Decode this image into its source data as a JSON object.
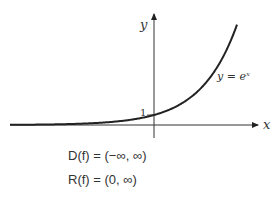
{
  "graph": {
    "function_label": "y = eˣ",
    "x_axis_label": "x",
    "y_axis_label": "y",
    "y_intercept_label": "1",
    "curve_color": "#222222"
  },
  "properties": {
    "domain": "D(f) = (−∞, ∞)",
    "range": "R(f) = (0, ∞)"
  }
}
